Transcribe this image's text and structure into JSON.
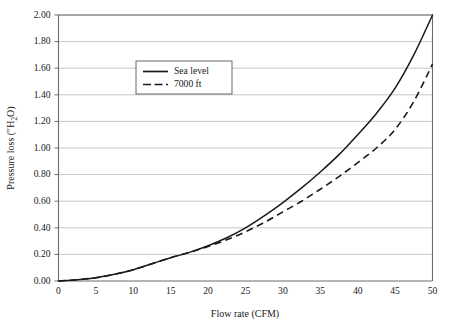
{
  "figure": {
    "background_color": "#ffffff",
    "line_color": "#1a1a1a",
    "grid_color": "#b9b9b9",
    "axis_color": "#6d6d6d"
  },
  "axes": {
    "x_title": "Flow rate (CFM)",
    "y_title_prefix": "Pressure loss (″H",
    "y_title_sub": "2",
    "y_title_suffix": "O)",
    "y_title_full": "Pressure loss (″H2O)",
    "x_ticks": [
      "0",
      "5",
      "10",
      "15",
      "20",
      "25",
      "30",
      "35",
      "40",
      "45",
      "50"
    ],
    "y_ticks": [
      "0.00",
      "0.20",
      "0.40",
      "0.60",
      "0.80",
      "1.00",
      "1.20",
      "1.40",
      "1.60",
      "1.80",
      "2.00"
    ]
  },
  "legend": {
    "position": "upper-left-inside",
    "entries": [
      {
        "label": "Sea level",
        "style": "solid"
      },
      {
        "label": "7000 ft",
        "style": "dashed"
      }
    ]
  },
  "chart_data": {
    "type": "line",
    "title": "",
    "xlabel": "Flow rate (CFM)",
    "ylabel": "Pressure loss (″H2O)",
    "xlim": [
      0,
      50
    ],
    "ylim": [
      0.0,
      2.0
    ],
    "xticks": [
      0,
      5,
      10,
      15,
      20,
      25,
      30,
      35,
      40,
      45,
      50
    ],
    "yticks": [
      0.0,
      0.2,
      0.4,
      0.6,
      0.8,
      1.0,
      1.2,
      1.4,
      1.6,
      1.8,
      2.0
    ],
    "grid": "horizontal",
    "legend_position": "upper left",
    "x": [
      0,
      2.5,
      5,
      7.5,
      10,
      12.5,
      15,
      17.5,
      20,
      22.5,
      25,
      27.5,
      30,
      32.5,
      35,
      37.5,
      40,
      42.5,
      45,
      47.5,
      50
    ],
    "series": [
      {
        "name": "Sea level",
        "style": "solid",
        "values": [
          0.0,
          0.01,
          0.025,
          0.05,
          0.085,
          0.13,
          0.175,
          0.215,
          0.265,
          0.325,
          0.4,
          0.49,
          0.59,
          0.7,
          0.82,
          0.95,
          1.1,
          1.26,
          1.45,
          1.7,
          2.0
        ]
      },
      {
        "name": "7000 ft",
        "style": "dashed",
        "values": [
          0.0,
          0.01,
          0.025,
          0.05,
          0.085,
          0.13,
          0.175,
          0.215,
          0.26,
          0.31,
          0.37,
          0.44,
          0.52,
          0.6,
          0.69,
          0.785,
          0.89,
          1.0,
          1.14,
          1.35,
          1.63
        ]
      }
    ]
  }
}
